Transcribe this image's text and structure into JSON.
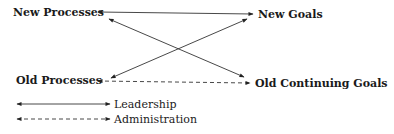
{
  "nodes": {
    "new_processes": "New Processes",
    "new_goals": "New Goals",
    "old_processes": "Old Processes",
    "old_continuing_goals": "Old Continuing Goals"
  },
  "edges": [
    {
      "from": "New Processes",
      "to": "New Goals",
      "style": "solid",
      "bidirectional": true
    },
    {
      "from": "Old Processes",
      "to": "New Goals",
      "style": "solid",
      "bidirectional": true
    },
    {
      "from": "New Processes",
      "to": "Old Continuing Goals",
      "style": "solid",
      "bidirectional": true
    },
    {
      "from": "Old Processes",
      "to": "Old Continuing Goals",
      "style": "dashed",
      "bidirectional": true
    }
  ],
  "legend": {
    "leadership": "Leadership",
    "administration": "Administration"
  },
  "colors": {
    "line": "#333333",
    "text": "#1a1a1a",
    "background": "#ffffff"
  }
}
